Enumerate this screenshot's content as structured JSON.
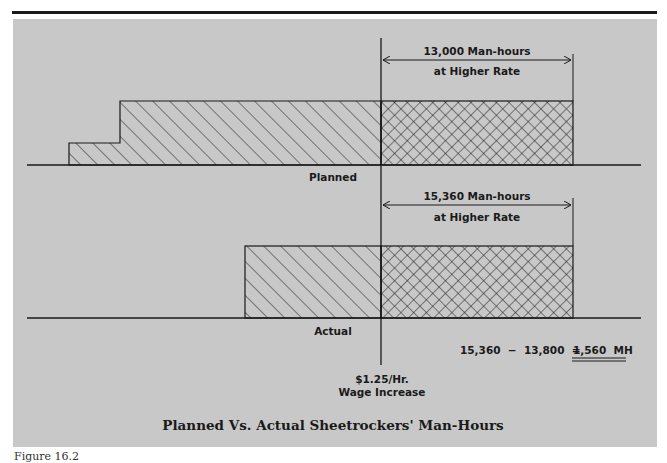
{
  "figure": {
    "title": "Planned Vs. Actual Sheetrockers' Man-Hours",
    "caption": "Figure 16.2"
  },
  "planned": {
    "label": "Planned",
    "dimension_line1": "13,000 Man-hours",
    "dimension_line2": "at Higher Rate"
  },
  "actual": {
    "label": "Actual",
    "dimension_line1": "15,360 Man-hours",
    "dimension_line2": "at Higher Rate"
  },
  "wage_marker": {
    "line1": "$1.25/Hr.",
    "line2": "Wage Increase"
  },
  "equation": {
    "lhs": "15,360  −  13,800  =",
    "result": "1,560  MH"
  },
  "colors": {
    "panel": "#c8c8c8",
    "ink": "#1a1a1a"
  }
}
